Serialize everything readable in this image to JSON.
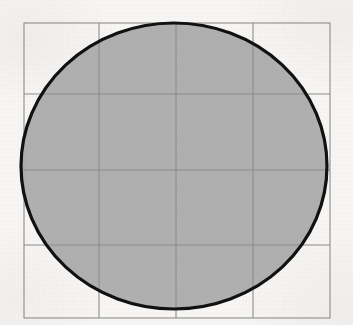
{
  "figure": {
    "title": "Circle inscribed in a square with a 4 by 4 grid",
    "kind": "geometry-diagram",
    "canvas": {
      "width": 353,
      "height": 325
    },
    "background": {
      "name": "paper-background",
      "color": "#f8f7f5",
      "texture": "scanned-paper-grain"
    },
    "square": {
      "label": "Bounding square",
      "x": 24,
      "y": 23,
      "width": 306,
      "height": 295,
      "stroke_color": "#8c8c8c",
      "stroke_width": 1.1,
      "fill": "none"
    },
    "grid": {
      "label": "4 by 4 grid",
      "rows": 4,
      "columns": 4,
      "stroke_color": "#8c8c8c",
      "stroke_width": 1.1,
      "vertical_lines_x": [
        99,
        176,
        253
      ],
      "horizontal_lines_y": [
        94,
        170,
        245
      ]
    },
    "circle": {
      "label": "Shaded circle",
      "center_x": 174,
      "center_y": 166,
      "radius_x": 153,
      "radius_y": 143,
      "fill_color": "#a8a8a8",
      "fill_opacity": 0.92,
      "stroke_color": "#111111",
      "stroke_width": 3.2
    }
  }
}
